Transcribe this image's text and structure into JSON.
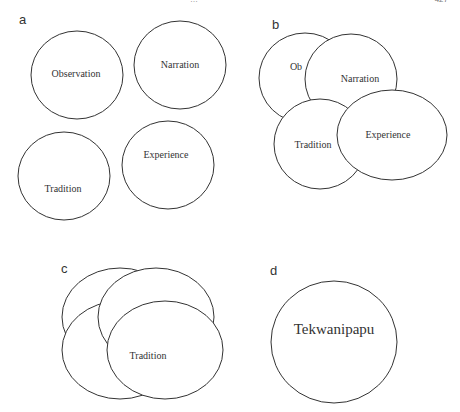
{
  "header": {
    "running_title": "…",
    "page_number": "427"
  },
  "panels": {
    "a": {
      "label": "a",
      "circles": [
        "Observation",
        "Narration",
        "Tradition",
        "Experience"
      ]
    },
    "b": {
      "label": "b",
      "circles": [
        "Ob",
        "Narration",
        "Tradition",
        "Experience"
      ]
    },
    "c": {
      "label": "c",
      "circles": [
        "Tradition"
      ]
    },
    "d": {
      "label": "d",
      "circles": [
        "Tekwanipapu"
      ]
    }
  },
  "colors": {
    "stroke": "#333333",
    "fill": "#ffffff",
    "text": "#333333"
  }
}
